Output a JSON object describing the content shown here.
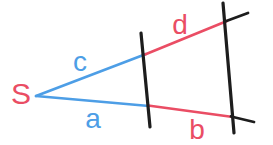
{
  "colors": {
    "background": "#ffffff",
    "blue": "#4d9ee6",
    "red": "#ea4d64",
    "black": "#1d1d1d"
  },
  "diagram": {
    "width": 273,
    "height": 145,
    "apex_label": "S",
    "lines": [
      {
        "name": "segment-c-blue",
        "color": "blue",
        "width": 2.6,
        "x1": 36,
        "y1": 96,
        "x2": 146,
        "y2": 54
      },
      {
        "name": "segment-a-blue",
        "color": "blue",
        "width": 2.6,
        "x1": 36,
        "y1": 96,
        "x2": 149,
        "y2": 106
      },
      {
        "name": "segment-d-red",
        "color": "red",
        "width": 2.6,
        "x1": 145,
        "y1": 54.5,
        "x2": 227,
        "y2": 21
      },
      {
        "name": "segment-b-red",
        "color": "red",
        "width": 2.6,
        "x1": 148,
        "y1": 105.5,
        "x2": 233,
        "y2": 117
      },
      {
        "name": "ray-extension-top-black",
        "color": "black",
        "width": 2.8,
        "x1": 225,
        "y1": 21.5,
        "x2": 248,
        "y2": 13
      },
      {
        "name": "ray-extension-bottom-black",
        "color": "black",
        "width": 2.8,
        "x1": 231,
        "y1": 116.5,
        "x2": 254,
        "y2": 122
      },
      {
        "name": "transversal-1-black",
        "color": "black",
        "width": 3.2,
        "x1": 141,
        "y1": 33,
        "x2": 150,
        "y2": 127
      },
      {
        "name": "transversal-2-black",
        "color": "black",
        "width": 3.2,
        "x1": 223,
        "y1": 3,
        "x2": 234,
        "y2": 133
      }
    ],
    "labels": [
      {
        "name": "label-apex-s",
        "text": "S",
        "color": "red",
        "x": 21,
        "y": 104,
        "size": 30
      },
      {
        "name": "label-c",
        "text": "c",
        "color": "blue",
        "x": 80,
        "y": 71,
        "size": 28
      },
      {
        "name": "label-a",
        "text": "a",
        "color": "blue",
        "x": 93,
        "y": 128,
        "size": 28
      },
      {
        "name": "label-d",
        "text": "d",
        "color": "red",
        "x": 180,
        "y": 34,
        "size": 28
      },
      {
        "name": "label-b",
        "text": "b",
        "color": "red",
        "x": 197,
        "y": 139,
        "size": 28
      }
    ]
  }
}
